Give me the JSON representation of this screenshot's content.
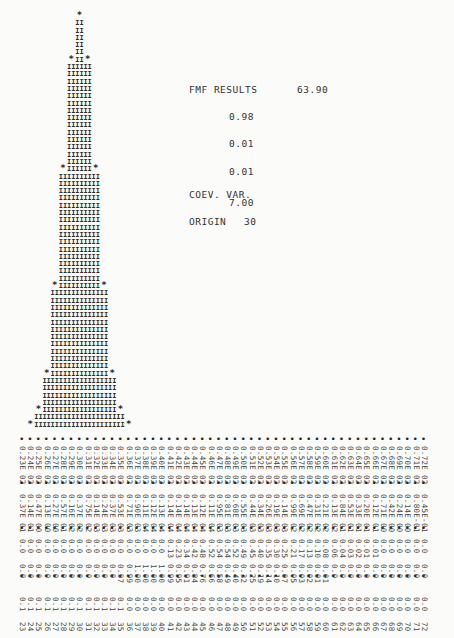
{
  "chart_data": {
    "type": "bar",
    "title": "FMF RESULTS",
    "xlabel": "",
    "ylabel": "",
    "categories": [
      23,
      24,
      25,
      26,
      27,
      28,
      29,
      30,
      31,
      32,
      33,
      34,
      35,
      36,
      37,
      38,
      39,
      40,
      41,
      42,
      43,
      44,
      45,
      46,
      47,
      48,
      49,
      50,
      51,
      52,
      53,
      54,
      55,
      56,
      57,
      58,
      59,
      60,
      61,
      62,
      63,
      64,
      65,
      66,
      67,
      68,
      69,
      70,
      71,
      72
    ],
    "values": [
      0,
      1,
      3,
      8,
      20,
      36,
      51,
      57,
      51,
      36,
      20,
      8,
      3,
      1,
      0,
      0,
      0,
      0,
      0,
      0,
      0,
      0,
      0,
      0,
      0,
      0,
      0,
      0,
      0,
      0,
      0,
      0,
      0,
      0,
      0,
      0,
      0,
      0,
      0,
      0,
      0,
      0,
      0,
      0,
      0,
      0,
      0,
      0,
      0,
      0
    ],
    "ylim": [
      0,
      58
    ],
    "grid": false,
    "bar_glyph": "II",
    "top_glyph": "*"
  },
  "results": {
    "label": "FMF RESULTS",
    "value_main": "63.90",
    "value_1": "0.98",
    "value_2": "0.01",
    "value_3": "0.01",
    "coev_label": "COEV. VAR.",
    "coev_value": "7.00",
    "origin_label": "ORIGIN",
    "origin_value": "30"
  },
  "table": {
    "row_a": [
      "0.23E 02",
      "0.24E 02",
      "0.25E 02",
      "0.26E 02",
      "0.27E 02",
      "0.28E 02",
      "0.29E 02",
      "0.30E 02",
      "0.31E 02",
      "0.32E 02",
      "0.33E 02",
      "0.34E 02",
      "0.35E 02",
      "0.36E 02",
      "0.37E 02",
      "0.38E 02",
      "0.39E 02",
      "0.40E 02",
      "0.41E 02",
      "0.42E 02",
      "0.43E 02",
      "0.44E 02",
      "0.45E 02",
      "0.46E 02",
      "0.47E 02",
      "0.48E 02",
      "0.49E 02",
      "0.50E 02",
      "0.51E 02",
      "0.52E 02",
      "0.53E 02",
      "0.54E 02",
      "0.55E 02",
      "0.56E 02",
      "0.57E 02",
      "0.58E 02",
      "0.59E 02",
      "0.60E 02",
      "0.61E 02",
      "0.62E 02",
      "0.63E 02",
      "0.64E 02",
      "0.65E 02",
      "0.66E 02",
      "0.67E 02",
      "0.68E 02",
      "0.69E 02",
      "0.70E 02",
      "0.71E 02",
      "0.72E 02"
    ],
    "row_b": [
      "0.37E 01",
      "0.14E 01",
      "0.47E 00",
      "0.13E 00",
      "0.27E 00",
      "0.57E 01",
      "0.16E 02",
      "0.37E 02",
      "0.75E 02",
      "0.14E 03",
      "0.24E 03",
      "0.37E 03",
      "0.53E 03",
      "0.71E 03",
      "0.90E 03",
      "0.11E 04",
      "0.12E 04",
      "0.13E 04",
      "0.14E 04",
      "0.14E 04",
      "0.14E 04",
      "0.13E 04",
      "0.12E 04",
      "0.11E 04",
      "0.95E 03",
      "0.81E 03",
      "0.68E 03",
      "0.55E 03",
      "0.44E 03",
      "0.34E 03",
      "0.26E 03",
      "0.19E 03",
      "0.14E 03",
      "0.99E 02",
      "0.69E 02",
      "0.47E 02",
      "0.31E 02",
      "0.21E 02",
      "0.13E 02",
      "0.84E 01",
      "0.53E 01",
      "0.33E 01",
      "0.20E 01",
      "0.12E 01",
      "0.71E 00",
      "0.42E 00",
      "0.24E 00",
      "0.14E 00",
      "0.80E-01",
      "0.45E-01"
    ],
    "row_c": [
      "0.0",
      "0.0",
      "0.0",
      "0.0",
      "0.0",
      "0.0",
      "0.0",
      "0.0",
      "0.0",
      "0.0",
      "0.0",
      "0.0",
      "0.0",
      "0.0",
      "0.0",
      "0.0",
      "0.0",
      "0.0",
      "0.13",
      "0.23",
      "0.34",
      "0.42",
      "0.48",
      "0.52",
      "0.54",
      "0.54",
      "0.52",
      "0.49",
      "0.45",
      "0.40",
      "0.35",
      "0.30",
      "0.25",
      "0.21",
      "0.17",
      "0.13",
      "0.10",
      "0.08",
      "0.06",
      "0.04",
      "0.03",
      "0.02",
      "0.01",
      "0.01",
      "0.0",
      "0.0",
      "0.0",
      "0.0",
      "0.0",
      "0.0"
    ],
    "row_d": [
      "0.0",
      "0.0",
      "0.0",
      "0.0",
      "0.0",
      "0.0",
      "0.0",
      "0.0",
      "0.0",
      "0.0",
      "0.0",
      "0.0",
      "0.97",
      "0.99",
      "1.00",
      "1.00",
      "1.00",
      "1.00",
      "0.99",
      "0.95",
      "0.91",
      "0.84",
      "0.76",
      "0.66",
      "0.58",
      "0.49",
      "0.40",
      "0.32",
      "0.25",
      "0.19",
      "0.14",
      "0.10",
      "0.07",
      "0.05",
      "0.03",
      "0.02",
      "0.01",
      "0.01",
      "0.0",
      "0.0",
      "0.0",
      "0.0",
      "0.0",
      "0.0",
      "0.0",
      "0.0",
      "0.0",
      "0.0",
      "0.0",
      "0.0"
    ],
    "row_e": [
      "0.1",
      "0.1",
      "0.1",
      "0.1",
      "0.1",
      "0.1",
      "0.1",
      "0.1",
      "0.1",
      "0.1",
      "0.1",
      "0.1",
      "0.1",
      "0.0",
      "0.0",
      "0.0",
      "0.0",
      "0.0",
      "0.0",
      "0.0",
      "0.0",
      "0.0",
      "0.0",
      "0.0",
      "0.0",
      "0.0",
      "0.0",
      "0.0",
      "0.0",
      "0.0",
      "0.0",
      "0.0",
      "0.0",
      "0.0",
      "0.0",
      "0.0",
      "0.0",
      "0.0",
      "0.0",
      "0.0",
      "0.0",
      "0.0",
      "0.0",
      "0.0",
      "0.0",
      "0.0",
      "0.0",
      "0.0",
      "0.0",
      "0.0"
    ],
    "bins": [
      "23",
      "24",
      "25",
      "26",
      "27",
      "28",
      "29",
      "30",
      "31",
      "32",
      "33",
      "34",
      "35",
      "36",
      "37",
      "38",
      "39",
      "40",
      "41",
      "42",
      "43",
      "44",
      "45",
      "46",
      "47",
      "48",
      "49",
      "50",
      "51",
      "52",
      "53",
      "54",
      "55",
      "56",
      "57",
      "58",
      "59",
      "60",
      "61",
      "62",
      "63",
      "64",
      "65",
      "66",
      "67",
      "68",
      "69",
      "70",
      "71",
      "72"
    ]
  }
}
